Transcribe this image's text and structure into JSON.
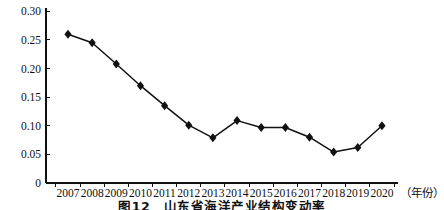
{
  "chart_data": {
    "type": "line",
    "x": [
      "2007",
      "2008",
      "2009",
      "2010",
      "2011",
      "2012",
      "2013",
      "2014",
      "2015",
      "2016",
      "2017",
      "2018",
      "2019",
      "2020"
    ],
    "values": [
      0.26,
      0.245,
      0.208,
      0.17,
      0.135,
      0.101,
      0.079,
      0.109,
      0.097,
      0.097,
      0.08,
      0.054,
      0.062,
      0.1
    ],
    "xlabel": "（年份）",
    "ylabel": "",
    "ylim": [
      0,
      0.3
    ],
    "ytick_interval": 0.05,
    "ytick_labels": [
      "0",
      "0.05",
      "0.10",
      "0.15",
      "0.20",
      "0.25",
      "0.30"
    ],
    "grid": false,
    "legend": null,
    "marker": "diamond",
    "line_color": "#111111",
    "marker_color": "#111111",
    "background_color": "#ffffff"
  },
  "caption": {
    "text": "图12　山东省海洋产业结构变动率"
  }
}
